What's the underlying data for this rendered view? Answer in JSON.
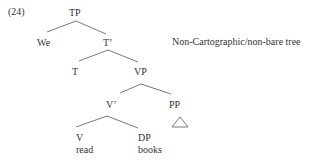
{
  "example_number": "(24)",
  "caption": "Non-Cartographic/non-bare tree",
  "nodes": {
    "tp": "TP",
    "we": "We",
    "t_bar": "T’",
    "t": "T",
    "vp": "VP",
    "v_bar": "V’",
    "pp": "PP",
    "v": "V",
    "read": "read",
    "dp": "DP",
    "books": "books"
  },
  "colors": {
    "line": "#6a6a6a",
    "text": "#333333"
  }
}
